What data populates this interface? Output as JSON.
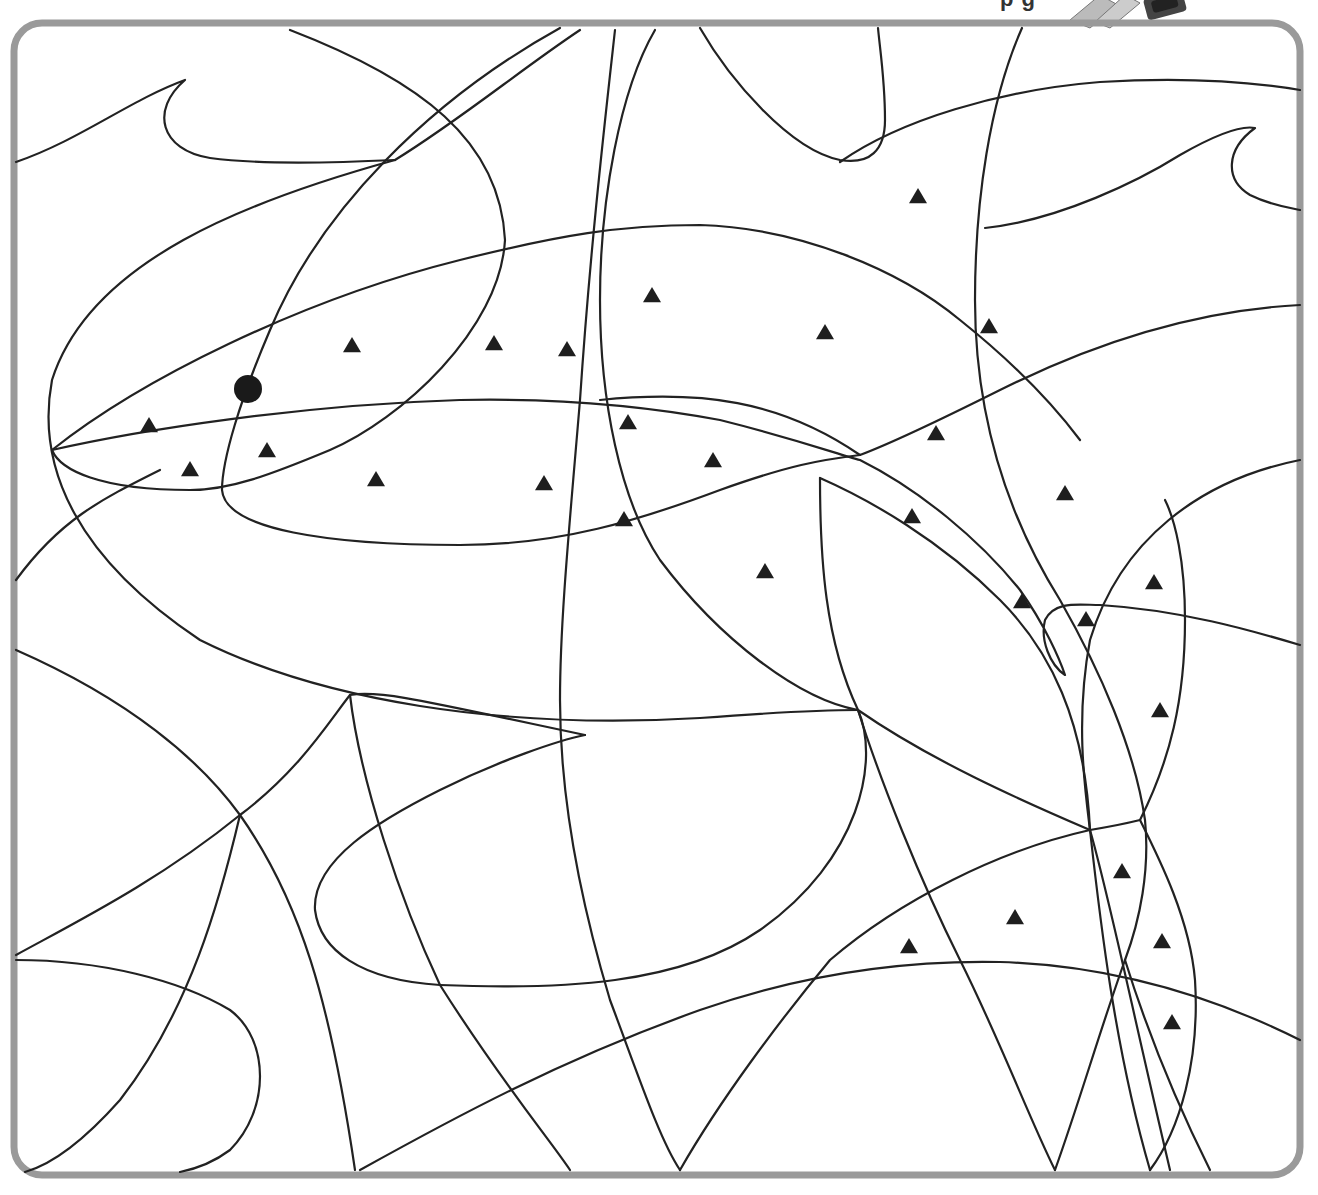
{
  "page": {
    "title_fragment": "p g",
    "frame_color": "#9a9a9a",
    "line_color": "#222222"
  },
  "puzzle": {
    "type": "hidden-picture coloring page",
    "subject": "shark",
    "marker_symbol": "triangle",
    "start_dot": {
      "x": 248,
      "y": 389,
      "r": 14
    },
    "triangles": [
      {
        "x": 918,
        "y": 197
      },
      {
        "x": 652,
        "y": 296
      },
      {
        "x": 352,
        "y": 346
      },
      {
        "x": 494,
        "y": 344
      },
      {
        "x": 567,
        "y": 350
      },
      {
        "x": 825,
        "y": 333
      },
      {
        "x": 989,
        "y": 327
      },
      {
        "x": 149,
        "y": 426
      },
      {
        "x": 628,
        "y": 423
      },
      {
        "x": 267,
        "y": 451
      },
      {
        "x": 936,
        "y": 434
      },
      {
        "x": 190,
        "y": 470
      },
      {
        "x": 376,
        "y": 480
      },
      {
        "x": 544,
        "y": 484
      },
      {
        "x": 713,
        "y": 461
      },
      {
        "x": 1065,
        "y": 494
      },
      {
        "x": 624,
        "y": 520
      },
      {
        "x": 912,
        "y": 517
      },
      {
        "x": 765,
        "y": 572
      },
      {
        "x": 1154,
        "y": 583
      },
      {
        "x": 1022,
        "y": 602
      },
      {
        "x": 1086,
        "y": 620
      },
      {
        "x": 1160,
        "y": 711
      },
      {
        "x": 1122,
        "y": 872
      },
      {
        "x": 1015,
        "y": 918
      },
      {
        "x": 909,
        "y": 947
      },
      {
        "x": 1162,
        "y": 942
      },
      {
        "x": 1172,
        "y": 1023
      }
    ]
  },
  "decoration": {
    "pencil_icon": "pencil-graphic-top-right"
  }
}
